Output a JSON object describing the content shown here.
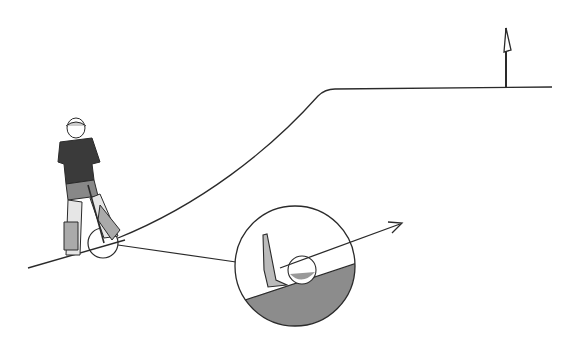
{
  "illustration": {
    "subject": "golf uphill lie shot",
    "elements": [
      "golfer",
      "slope-line",
      "hill-curve",
      "flag",
      "magnified-inset",
      "ball",
      "club-head",
      "ball-trajectory-arrow"
    ],
    "colors": {
      "line": "#2a2a2a",
      "ground_fill": "#8c8c8c",
      "background": "#ffffff"
    }
  }
}
